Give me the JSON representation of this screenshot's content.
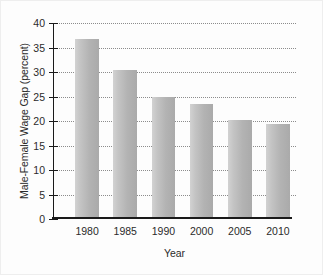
{
  "chart_data": {
    "type": "bar",
    "title": "",
    "subtitle": "",
    "xlabel": "Year",
    "ylabel": "Male-Female Wage Gap (percent)",
    "categories": [
      "1980",
      "1985",
      "1990",
      "2000",
      "2005",
      "2010"
    ],
    "values": [
      36.5,
      30.0,
      24.6,
      23.2,
      19.8,
      19.1
    ],
    "series": [
      {
        "name": "Male-Female Wage Gap",
        "values": [
          36.5,
          30.0,
          24.6,
          23.2,
          19.8,
          19.1
        ]
      }
    ],
    "ylim": [
      0,
      40
    ],
    "yticks": [
      0,
      5,
      10,
      15,
      20,
      25,
      30,
      35,
      40
    ],
    "ytick_labels": [
      "0",
      "5",
      "10",
      "15",
      "20",
      "25",
      "30",
      "35",
      "40"
    ],
    "xtick_labels": [
      "1980",
      "1985",
      "1990",
      "2000",
      "2005",
      "2010"
    ],
    "grid": true,
    "grid_axis": "y",
    "grid_style": "dotted",
    "legend": false,
    "legend_position": "none",
    "bar_color": "#b5b5b5",
    "axis_color": "#1a1a1a",
    "grid_color": "#8c8c8c",
    "text_color": "#2b2b2b",
    "background_color": "#fdfdfd",
    "annotations": []
  }
}
